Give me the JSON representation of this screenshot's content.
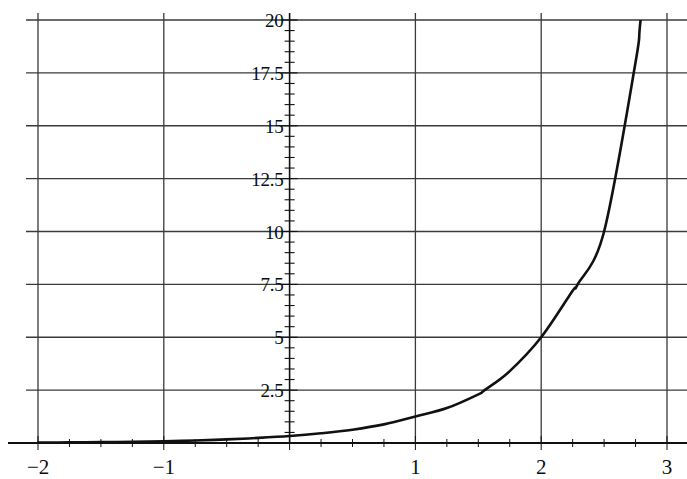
{
  "chart_data": {
    "type": "line",
    "title": "",
    "subtitle": "",
    "xlabel": "",
    "ylabel": "",
    "xlim": [
      -2,
      3
    ],
    "ylim": [
      0,
      20
    ],
    "grid": true,
    "legend": null,
    "x_ticks": [
      -2,
      -1,
      1,
      2,
      3
    ],
    "x_tick_labels": [
      "−2",
      "−1",
      "1",
      "2",
      "3"
    ],
    "y_ticks": [
      2.5,
      5,
      7.5,
      10,
      12.5,
      15,
      17.5,
      20
    ],
    "y_tick_labels": [
      "2.5",
      "5",
      "7.5",
      "10",
      "12.5",
      "15",
      "17.5",
      "20"
    ],
    "x_minor_tick_step": 0.25,
    "y_minor_tick_step": 0.5,
    "curve_color": "#111111",
    "grid_color": "#3a3a3a",
    "axis_color": "#111111",
    "background_color": "#ffffff",
    "series": [
      {
        "name": "curve",
        "x": [
          -2,
          -1.75,
          -1.5,
          -1.25,
          -1,
          -0.75,
          -0.5,
          -0.25,
          0,
          0.25,
          0.5,
          0.75,
          1,
          1.25,
          1.5,
          1.55,
          1.75,
          2,
          2.25,
          2.29,
          2.5,
          2.75,
          2.79,
          2.9
        ],
        "y": [
          0.02,
          0.03,
          0.04,
          0.06,
          0.08,
          0.12,
          0.17,
          0.24,
          0.33,
          0.46,
          0.63,
          0.88,
          1.25,
          1.65,
          2.3,
          2.5,
          3.4,
          5.0,
          7.2,
          7.5,
          10.0,
          18.0,
          20.0,
          26.0
        ]
      }
    ],
    "annotations": [
      {
        "text": "curve passes through (2, 5)",
        "x": 2,
        "y": 5
      },
      {
        "text": "curve passes through (2.5, 10)",
        "x": 2.5,
        "y": 10
      },
      {
        "text": "curve reaches top of frame at y = 20",
        "x": 2.79,
        "y": 20
      }
    ]
  },
  "axes": {
    "y_labels": [
      "20",
      "17.5",
      "15",
      "12.5",
      "10",
      "7.5",
      "5",
      "2.5"
    ],
    "x_labels": [
      "−2",
      "−1",
      "1",
      "2",
      "3"
    ]
  }
}
